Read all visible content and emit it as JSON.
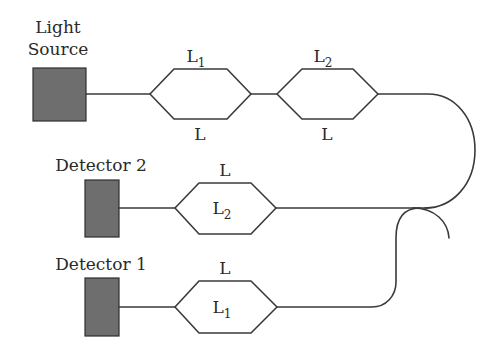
{
  "diagram": {
    "type": "fiber-optic-interferometer-setup",
    "components": {
      "light_source": {
        "label_line1": "Light",
        "label_line2": "Source",
        "color": "#6e6e6e"
      },
      "detector_2": {
        "label": "Detector 2",
        "color": "#6e6e6e"
      },
      "detector_1": {
        "label": "Detector 1",
        "color": "#6e6e6e"
      }
    },
    "interferometers": [
      {
        "id": "mz-1",
        "top_label": "L",
        "top_sub": "1",
        "bottom_label": "L",
        "bottom_sub": ""
      },
      {
        "id": "mz-2",
        "top_label": "L",
        "top_sub": "2",
        "bottom_label": "L",
        "bottom_sub": ""
      },
      {
        "id": "mz-3",
        "top_label": "L",
        "top_sub": "",
        "inner_label": "L",
        "inner_sub": "2"
      },
      {
        "id": "mz-4",
        "top_label": "L",
        "top_sub": "",
        "inner_label": "L",
        "inner_sub": "1"
      }
    ],
    "coupler": {
      "type": "fiber-coupler"
    },
    "line_color": "#3a3a3a",
    "background": "#ffffff"
  }
}
